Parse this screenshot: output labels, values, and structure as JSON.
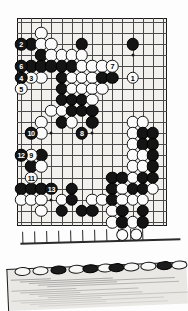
{
  "page": {
    "kind": "scanned-go-book-page",
    "width": 188,
    "height": 311,
    "background_color": "#ffffff"
  },
  "diagram": {
    "name": "go-board-diagram",
    "board_size": 15,
    "cols": 15,
    "rows": 19,
    "board_color": "#f2f1ee",
    "line_color": "#4a4a4a",
    "border_color": "#1a1a1a",
    "black_color": "#141414",
    "white_color": "#fbfbfb",
    "hoshi": [
      {
        "c": 3,
        "r": 3
      },
      {
        "c": 11,
        "r": 3
      },
      {
        "c": 3,
        "r": 10
      },
      {
        "c": 11,
        "r": 10
      },
      {
        "c": 7,
        "r": 10
      },
      {
        "c": 3,
        "r": 16
      },
      {
        "c": 11,
        "r": 16
      }
    ],
    "numbered_moves": [
      {
        "n": "1",
        "color": "white",
        "c": 11,
        "r": 5
      },
      {
        "n": "2",
        "color": "black",
        "c": 0,
        "r": 2
      },
      {
        "n": "3",
        "color": "white",
        "c": 1,
        "r": 5
      },
      {
        "n": "4",
        "color": "black",
        "c": 0,
        "r": 5
      },
      {
        "n": "5",
        "color": "white",
        "c": 0,
        "r": 6
      },
      {
        "n": "6",
        "color": "black",
        "c": 0,
        "r": 4
      },
      {
        "n": "7",
        "color": "white",
        "c": 9,
        "r": 4
      },
      {
        "n": "8",
        "color": "black",
        "c": 6,
        "r": 10
      },
      {
        "n": "9",
        "color": "white",
        "c": 1,
        "r": 12
      },
      {
        "n": "10",
        "color": "black",
        "c": 1,
        "r": 10
      },
      {
        "n": "11",
        "color": "white",
        "c": 1,
        "r": 14
      },
      {
        "n": "12",
        "color": "black",
        "c": 0,
        "r": 12
      },
      {
        "n": "13",
        "color": "black",
        "c": 3,
        "r": 15
      }
    ],
    "plain_stones": [
      {
        "color": "white",
        "c": 2,
        "r": 1
      },
      {
        "color": "black",
        "c": 1,
        "r": 2
      },
      {
        "color": "white",
        "c": 2,
        "r": 2
      },
      {
        "color": "white",
        "c": 3,
        "r": 2
      },
      {
        "color": "black",
        "c": 6,
        "r": 2
      },
      {
        "color": "black",
        "c": 11,
        "r": 2
      },
      {
        "color": "black",
        "c": 2,
        "r": 3
      },
      {
        "color": "white",
        "c": 3,
        "r": 3
      },
      {
        "color": "white",
        "c": 4,
        "r": 3
      },
      {
        "color": "white",
        "c": 5,
        "r": 3
      },
      {
        "color": "white",
        "c": 6,
        "r": 3
      },
      {
        "color": "black",
        "c": 1,
        "r": 4
      },
      {
        "color": "black",
        "c": 2,
        "r": 4
      },
      {
        "color": "black",
        "c": 3,
        "r": 4
      },
      {
        "color": "black",
        "c": 4,
        "r": 4
      },
      {
        "color": "black",
        "c": 5,
        "r": 4
      },
      {
        "color": "white",
        "c": 6,
        "r": 4
      },
      {
        "color": "white",
        "c": 7,
        "r": 4
      },
      {
        "color": "white",
        "c": 8,
        "r": 4
      },
      {
        "color": "white",
        "c": 2,
        "r": 5
      },
      {
        "color": "black",
        "c": 4,
        "r": 5
      },
      {
        "color": "white",
        "c": 5,
        "r": 5
      },
      {
        "color": "white",
        "c": 6,
        "r": 5
      },
      {
        "color": "white",
        "c": 7,
        "r": 5
      },
      {
        "color": "black",
        "c": 8,
        "r": 5
      },
      {
        "color": "black",
        "c": 9,
        "r": 5
      },
      {
        "color": "black",
        "c": 4,
        "r": 6
      },
      {
        "color": "white",
        "c": 5,
        "r": 6
      },
      {
        "color": "white",
        "c": 6,
        "r": 6
      },
      {
        "color": "white",
        "c": 7,
        "r": 6
      },
      {
        "color": "white",
        "c": 8,
        "r": 6
      },
      {
        "color": "black",
        "c": 4,
        "r": 7
      },
      {
        "color": "black",
        "c": 5,
        "r": 7
      },
      {
        "color": "black",
        "c": 6,
        "r": 7
      },
      {
        "color": "white",
        "c": 7,
        "r": 7
      },
      {
        "color": "white",
        "c": 3,
        "r": 8
      },
      {
        "color": "white",
        "c": 4,
        "r": 8
      },
      {
        "color": "black",
        "c": 5,
        "r": 8
      },
      {
        "color": "black",
        "c": 6,
        "r": 8
      },
      {
        "color": "black",
        "c": 7,
        "r": 8
      },
      {
        "color": "white",
        "c": 2,
        "r": 9
      },
      {
        "color": "black",
        "c": 4,
        "r": 9
      },
      {
        "color": "white",
        "c": 5,
        "r": 9
      },
      {
        "color": "black",
        "c": 7,
        "r": 9
      },
      {
        "color": "white",
        "c": 11,
        "r": 9
      },
      {
        "color": "white",
        "c": 12,
        "r": 9
      },
      {
        "color": "white",
        "c": 2,
        "r": 10
      },
      {
        "color": "white",
        "c": 11,
        "r": 10
      },
      {
        "color": "black",
        "c": 12,
        "r": 10
      },
      {
        "color": "black",
        "c": 13,
        "r": 10
      },
      {
        "color": "white",
        "c": 11,
        "r": 11
      },
      {
        "color": "black",
        "c": 12,
        "r": 11
      },
      {
        "color": "black",
        "c": 13,
        "r": 11
      },
      {
        "color": "black",
        "c": 2,
        "r": 12
      },
      {
        "color": "white",
        "c": 11,
        "r": 12
      },
      {
        "color": "white",
        "c": 12,
        "r": 12
      },
      {
        "color": "black",
        "c": 13,
        "r": 12
      },
      {
        "color": "black",
        "c": 1,
        "r": 13
      },
      {
        "color": "white",
        "c": 2,
        "r": 13
      },
      {
        "color": "white",
        "c": 11,
        "r": 13
      },
      {
        "color": "white",
        "c": 12,
        "r": 13
      },
      {
        "color": "black",
        "c": 13,
        "r": 13
      },
      {
        "color": "black",
        "c": 9,
        "r": 14
      },
      {
        "color": "black",
        "c": 10,
        "r": 14
      },
      {
        "color": "white",
        "c": 11,
        "r": 14
      },
      {
        "color": "black",
        "c": 12,
        "r": 14
      },
      {
        "color": "black",
        "c": 13,
        "r": 14
      },
      {
        "color": "black",
        "c": 0,
        "r": 15
      },
      {
        "color": "black",
        "c": 1,
        "r": 15
      },
      {
        "color": "black",
        "c": 2,
        "r": 15
      },
      {
        "color": "black",
        "c": 5,
        "r": 15
      },
      {
        "color": "black",
        "c": 9,
        "r": 15
      },
      {
        "color": "white",
        "c": 10,
        "r": 15
      },
      {
        "color": "black",
        "c": 11,
        "r": 15
      },
      {
        "color": "black",
        "c": 12,
        "r": 15
      },
      {
        "color": "white",
        "c": 13,
        "r": 15
      },
      {
        "color": "white",
        "c": 0,
        "r": 16
      },
      {
        "color": "white",
        "c": 1,
        "r": 16
      },
      {
        "color": "white",
        "c": 2,
        "r": 16
      },
      {
        "color": "white",
        "c": 4,
        "r": 16
      },
      {
        "color": "black",
        "c": 5,
        "r": 16
      },
      {
        "color": "white",
        "c": 7,
        "r": 16
      },
      {
        "color": "white",
        "c": 8,
        "r": 16
      },
      {
        "color": "black",
        "c": 9,
        "r": 16
      },
      {
        "color": "white",
        "c": 10,
        "r": 16
      },
      {
        "color": "white",
        "c": 11,
        "r": 16
      },
      {
        "color": "white",
        "c": 12,
        "r": 16
      },
      {
        "color": "white",
        "c": 2,
        "r": 17
      },
      {
        "color": "black",
        "c": 4,
        "r": 17
      },
      {
        "color": "black",
        "c": 6,
        "r": 17
      },
      {
        "color": "black",
        "c": 7,
        "r": 17
      },
      {
        "color": "white",
        "c": 9,
        "r": 17
      },
      {
        "color": "black",
        "c": 10,
        "r": 17
      },
      {
        "color": "black",
        "c": 12,
        "r": 17
      },
      {
        "color": "white",
        "c": 9,
        "r": 18
      },
      {
        "color": "black",
        "c": 10,
        "r": 18
      },
      {
        "color": "white",
        "c": 11,
        "r": 18
      },
      {
        "color": "black",
        "c": 12,
        "r": 18
      }
    ]
  },
  "fragment": {
    "name": "cut-off-diagram-fragment",
    "stones": [
      {
        "color": "white",
        "cx": 110,
        "cy": 10
      },
      {
        "color": "white",
        "cx": 124,
        "cy": 10
      }
    ],
    "tick_count": 11
  },
  "scan_strip": {
    "name": "skewed-scan-strip",
    "board_color": "#e9e8e4",
    "stones": [
      {
        "color": "white",
        "cx": 16,
        "cy": 12
      },
      {
        "color": "white",
        "cx": 34,
        "cy": 12
      },
      {
        "color": "black",
        "cx": 52,
        "cy": 12
      },
      {
        "color": "white",
        "cx": 70,
        "cy": 12
      },
      {
        "color": "black",
        "cx": 84,
        "cy": 12
      },
      {
        "color": "white",
        "cx": 99,
        "cy": 12
      },
      {
        "color": "black",
        "cx": 110,
        "cy": 12
      },
      {
        "color": "white",
        "cx": 125,
        "cy": 12
      },
      {
        "color": "white",
        "cx": 142,
        "cy": 12
      },
      {
        "color": "black",
        "cx": 158,
        "cy": 12
      },
      {
        "color": "white",
        "cx": 173,
        "cy": 12
      }
    ],
    "smear_count": 14
  }
}
